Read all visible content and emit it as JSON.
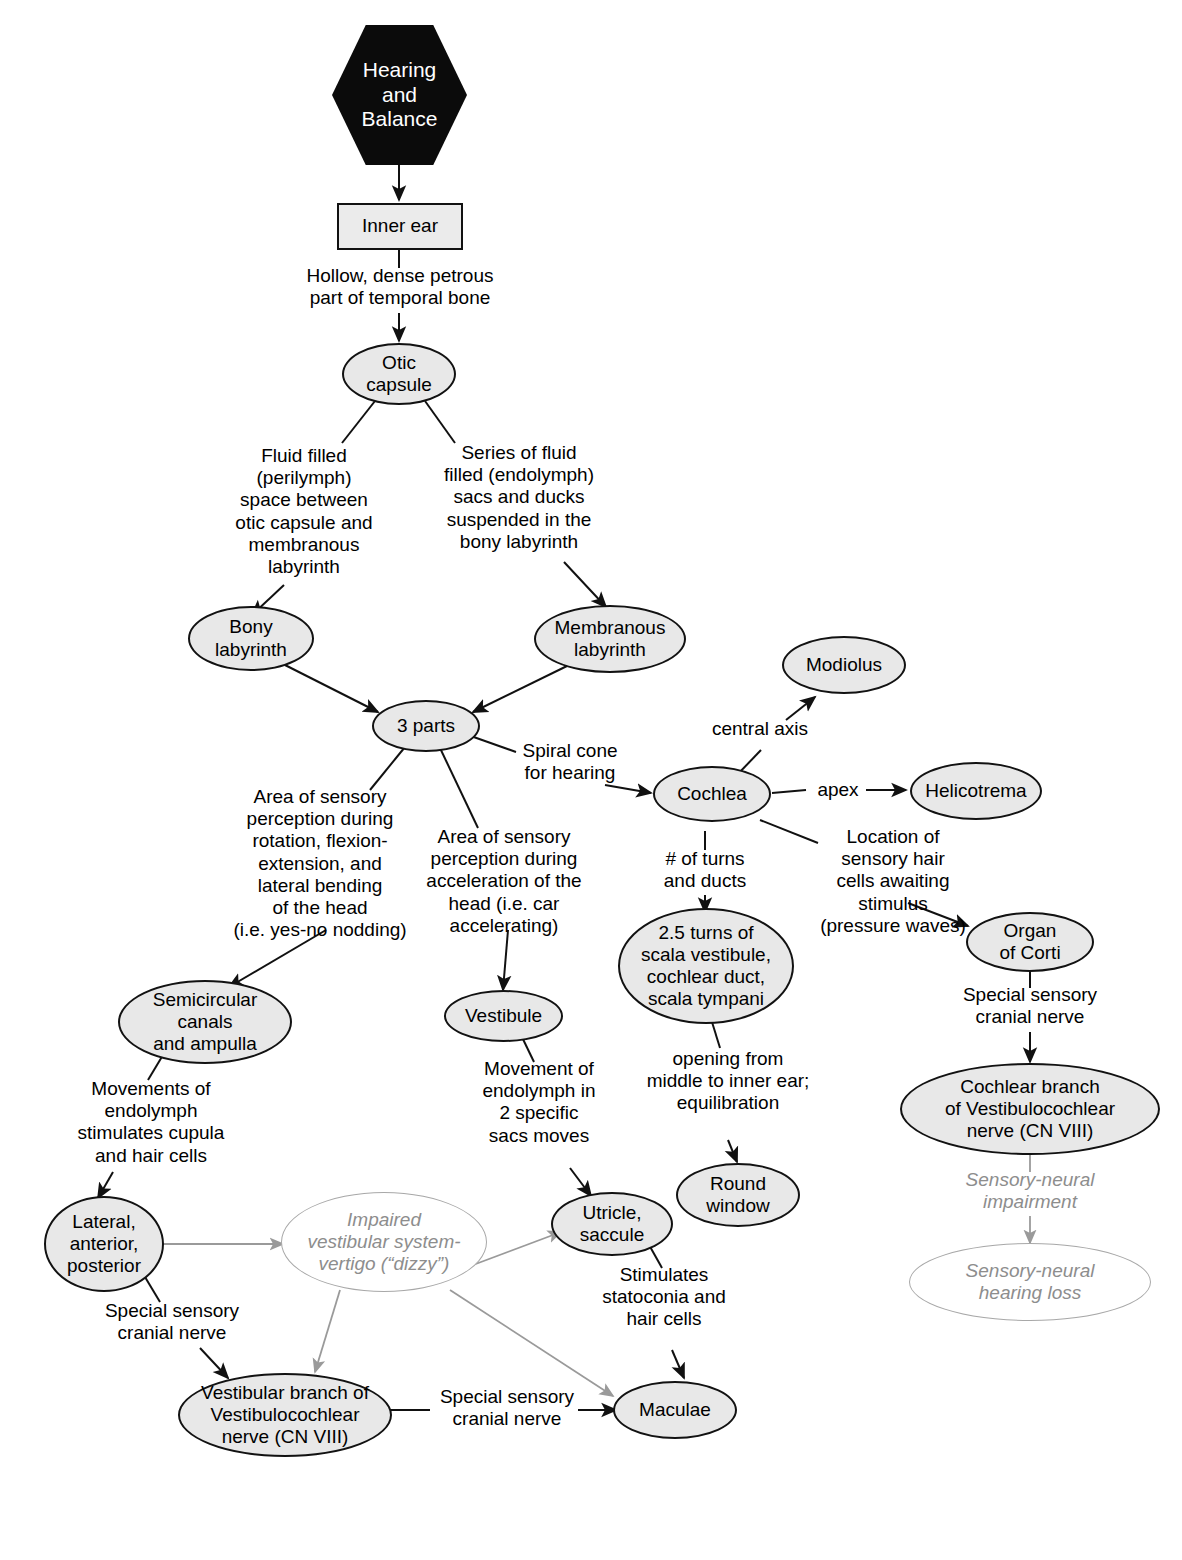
{
  "diagram": {
    "title": "Hearing and Balance",
    "type": "concept-map",
    "theme": {
      "node_fill": "#e8e8e8",
      "node_stroke": "#121212",
      "root_fill": "#0b0b0b",
      "root_text": "#ffffff",
      "ghost_stroke": "#a8a8a8",
      "ghost_text": "#8d8d8d",
      "background": "#ffffff"
    }
  },
  "nodes": {
    "root": "Hearing\nand\nBalance",
    "inner_ear": "Inner ear",
    "otic_capsule": "Otic\ncapsule",
    "bony_labyrinth": "Bony\nlabyrinth",
    "membranous_labyrinth": "Membranous\nlabyrinth",
    "three_parts": "3 parts",
    "modiolus": "Modiolus",
    "cochlea": "Cochlea",
    "helicotrema": "Helicotrema",
    "semicircular": "Semicircular\ncanals\nand ampulla",
    "vestibule": "Vestibule",
    "turns": "2.5 turns of\nscala vestibule,\ncochlear duct,\nscala tympani",
    "organ_of_corti": "Organ\nof Corti",
    "cochlear_branch": "Cochlear branch\nof Vestibulocochlear\nnerve (CN VIII)",
    "sensory_neural_hearing_loss": "Sensory-neural\nhearing loss",
    "lateral_anterior_posterior": "Lateral,\nanterior,\nposterior",
    "impaired_vestibular": "Impaired\nvestibular system-\nvertigo (“dizzy”)",
    "utricle_saccule": "Utricle,\nsaccule",
    "round_window": "Round\nwindow",
    "vestibular_branch": "Vestibular branch of\nVestibulocochlear\nnerve (CN VIII)",
    "maculae": "Maculae"
  },
  "edge_labels": {
    "petrous": "Hollow, dense petrous\npart of temporal bone",
    "perilymph": "Fluid filled\n(perilymph)\nspace between\notic capsule and\nmembranous\nlabyrinth",
    "endolymph_sacs": "Series of fluid\nfilled (endolymph)\nsacs and ducks\nsuspended in the\nbony labyrinth",
    "spiral_cone": "Spiral cone\nfor hearing",
    "central_axis": "central axis",
    "apex": "apex",
    "turns_ducts": "# of turns\nand ducts",
    "hair_cells_location": "Location of\nsensory hair\ncells awaiting\nstimulus\n(pressure waves)",
    "rotation_area": "Area of sensory\nperception during\nrotation, flexion-\nextension, and\nlateral bending\nof the head\n(i.e. yes-no nodding)",
    "acceleration_area": "Area of sensory\nperception during\nacceleration of the\nhead (i.e. car\naccelerating)",
    "special_sensory_corti": "Special sensory\ncranial nerve",
    "sensory_neural_impairment": "Sensory-neural\nimpairment",
    "endolymph_movements": "Movements of\nendolymph\nstimulates cupula\nand hair cells",
    "special_sensory_lateral": "Special sensory\ncranial nerve",
    "movement_endolymph": "Movement of\nendolymph in\n2 specific\nsacs moves",
    "opening_middle": "opening from\nmiddle to inner ear;\nequilibration",
    "stimulates_statoconia": "Stimulates\nstatoconia and\nhair cells",
    "special_sensory_maculae": "Special sensory\ncranial nerve"
  }
}
